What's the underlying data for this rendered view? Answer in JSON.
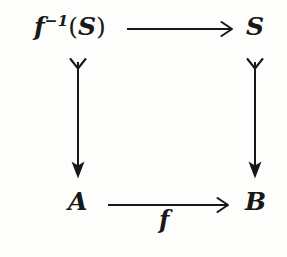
{
  "diagram": {
    "kind": "commutative-square",
    "title": "",
    "background_color": "#fdfdfb",
    "ink_color": "#181818",
    "nodes": {
      "top_left": {
        "base": "f",
        "superscript": "−1",
        "argument_open": "(",
        "argument": "S",
        "argument_close": ")",
        "plain": "f^{-1}(S)"
      },
      "top_right": {
        "plain": "S"
      },
      "bottom_left": {
        "plain": "A"
      },
      "bottom_right": {
        "plain": "B"
      }
    },
    "arrows": [
      {
        "name": "top-arrow",
        "from": "f^{-1}(S)",
        "to": "S",
        "direction": "right",
        "head": "open-barbed",
        "tail": "none",
        "label": ""
      },
      {
        "name": "left-arrow",
        "from": "f^{-1}(S)",
        "to": "A",
        "direction": "down",
        "head": "solid",
        "tail": "hook-v",
        "label": ""
      },
      {
        "name": "right-arrow",
        "from": "S",
        "to": "B",
        "direction": "down",
        "head": "solid",
        "tail": "hook-v",
        "label": ""
      },
      {
        "name": "bottom-arrow",
        "from": "A",
        "to": "B",
        "direction": "right",
        "head": "open-barbed",
        "tail": "none",
        "label": "f"
      }
    ],
    "labels": {
      "bottom_arrow_label": "f"
    }
  }
}
